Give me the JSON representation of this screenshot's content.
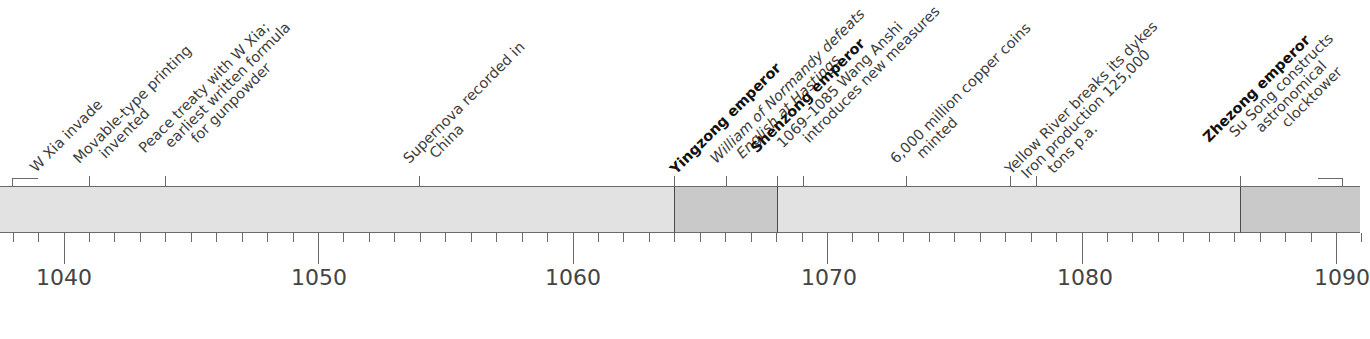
{
  "axis": {
    "start_year": 1038,
    "end_year": 1091,
    "major_labels": [
      "1040",
      "1050",
      "1060",
      "1070",
      "1080",
      "1090"
    ],
    "colors": {
      "band": "#e2e2e2",
      "reign": "#c9c9c9",
      "line": "#6a6a6a",
      "text": "#3c3c3c"
    }
  },
  "reigns": [
    {
      "name": "Yingzong emperor",
      "start": 1064,
      "end": 1068
    },
    {
      "name": "Zhezong emperor",
      "start": 1086,
      "end": 1091
    }
  ],
  "events": [
    {
      "year": "1038–1039",
      "lines": [
        "W Xia invade"
      ]
    },
    {
      "year": "1041",
      "lines": [
        "Movable-type printing",
        "invented"
      ]
    },
    {
      "year": "1044",
      "lines": [
        "Peace treaty with W Xia;",
        "earliest written formula",
        "for gunpowder"
      ]
    },
    {
      "year": "1054",
      "lines": [
        "Supernova recorded in",
        "China"
      ]
    },
    {
      "year": "1064",
      "lines": [
        "Yingzong emperor"
      ]
    },
    {
      "year": "1066",
      "lines": [
        "William of Normandy defeats",
        "English at Hastings"
      ]
    },
    {
      "year": "1068",
      "lines": [
        "Shenzong emperor",
        "1069–1085 Wang Anshi",
        "introduces new measures"
      ]
    },
    {
      "year": "1073",
      "lines": [
        "6,000 million copper coins",
        "minted"
      ]
    },
    {
      "year": "1077",
      "lines": [
        "Yellow River breaks its dykes"
      ]
    },
    {
      "year": "1078",
      "lines": [
        "Iron production 125,000",
        "tons p.a."
      ]
    },
    {
      "year": "1086",
      "lines": [
        "Zhezong emperor",
        "Su Song constructs",
        "astronomical",
        "clocktower"
      ]
    }
  ]
}
